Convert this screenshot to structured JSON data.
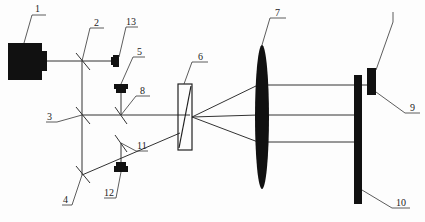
{
  "diagram": {
    "type": "optical-setup",
    "colors": {
      "ink": "#111111",
      "line": "#333333",
      "background": "#fdfdfd"
    },
    "labels": {
      "l1": "1",
      "l2": "2",
      "l3": "3",
      "l4": "4",
      "l5": "5",
      "l6": "6",
      "l7": "7",
      "l8": "8",
      "l9": "9",
      "l10": "10",
      "l11": "11",
      "l12": "12",
      "l13": "13"
    },
    "components": [
      {
        "id": "1",
        "kind": "laser-source"
      },
      {
        "id": "2",
        "kind": "beam-splitter"
      },
      {
        "id": "3",
        "kind": "mirror"
      },
      {
        "id": "4",
        "kind": "mirror"
      },
      {
        "id": "5",
        "kind": "detector"
      },
      {
        "id": "6",
        "kind": "prism"
      },
      {
        "id": "7",
        "kind": "lens"
      },
      {
        "id": "8",
        "kind": "beam-splitter"
      },
      {
        "id": "9",
        "kind": "block"
      },
      {
        "id": "10",
        "kind": "plate"
      },
      {
        "id": "11",
        "kind": "beam-splitter"
      },
      {
        "id": "12",
        "kind": "detector"
      },
      {
        "id": "13",
        "kind": "detector"
      }
    ]
  }
}
